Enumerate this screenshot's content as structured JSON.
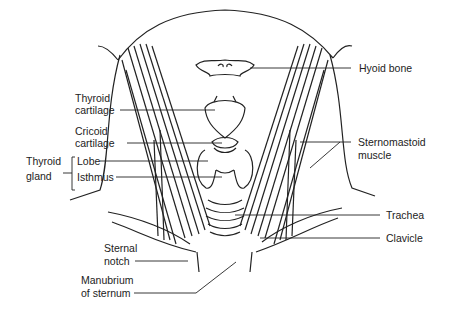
{
  "diagram": {
    "labels": {
      "hyoid_bone": "Hyoid bone",
      "thyroid_cartilage_1": "Thyroid",
      "thyroid_cartilage_2": "cartilage",
      "cricoid_cartilage_1": "Cricoid",
      "cricoid_cartilage_2": "cartilage",
      "thyroid_gland_1": "Thyroid",
      "thyroid_gland_2": "gland",
      "lobe": "Lobe",
      "isthmus": "Isthmus",
      "sternomastoid_1": "Sternomastoid",
      "sternomastoid_2": "muscle",
      "trachea": "Trachea",
      "clavicle": "Clavicle",
      "sternal_notch_1": "Sternal",
      "sternal_notch_2": "notch",
      "manubrium_1": "Manubrium",
      "manubrium_2": "of sternum"
    },
    "line_color": "#222222"
  }
}
